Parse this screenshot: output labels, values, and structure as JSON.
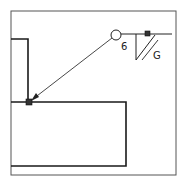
{
  "diagram": {
    "type": "welding-symbol",
    "weld_size_label": "6",
    "finish_label": "G",
    "symbols": {
      "weld_all_around": "circle",
      "field_weld": "flag",
      "weld_type": "bevel-groove"
    },
    "colors": {
      "line": "#1a1a1a",
      "frame": "#444444",
      "marker": "#333333",
      "background": "#ffffff"
    }
  }
}
